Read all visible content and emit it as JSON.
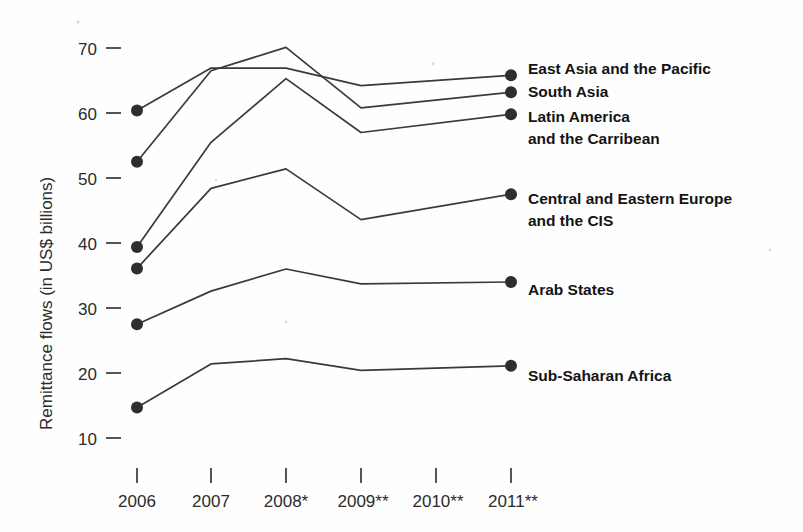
{
  "chart_data": {
    "type": "line",
    "title": "",
    "xlabel": "",
    "ylabel": "Remittance flows (in US$ billions)",
    "categories": [
      "2006",
      "2007",
      "2008*",
      "2009**",
      "2010**",
      "2011**"
    ],
    "x_tick_labels": [
      "2006",
      "2007",
      "2008*",
      "2009**",
      "2010**",
      "2011**"
    ],
    "y_tick_labels": [
      "70",
      "60",
      "50",
      "40",
      "30",
      "20",
      "10"
    ],
    "y_ticks": [
      70,
      60,
      50,
      40,
      30,
      20,
      10
    ],
    "ylim": [
      8,
      72
    ],
    "grid": false,
    "legend_position": "right-inline-labels",
    "marker_years": [
      "2006",
      "2011**"
    ],
    "footnote_markers": [
      "*",
      "**"
    ],
    "series": [
      {
        "name": "East Asia and the Pacific",
        "label": "East Asia and the Pacific",
        "values": [
          60.4,
          66.9,
          66.9,
          64.2,
          null,
          65.8
        ],
        "vertices": [
          {
            "x": "2006",
            "y": 60.4
          },
          {
            "x": "2007",
            "y": 66.9
          },
          {
            "x": "2008*",
            "y": 66.9
          },
          {
            "x": "2009**",
            "y": 64.2
          },
          {
            "x": "2011**",
            "y": 65.8
          }
        ]
      },
      {
        "name": "South Asia",
        "label": "South Asia",
        "values": [
          52.5,
          66.5,
          70.1,
          60.8,
          null,
          63.2
        ],
        "vertices": [
          {
            "x": "2006",
            "y": 52.5
          },
          {
            "x": "2007",
            "y": 66.5
          },
          {
            "x": "2008*",
            "y": 70.1
          },
          {
            "x": "2009**",
            "y": 60.8
          },
          {
            "x": "2011**",
            "y": 63.2
          }
        ]
      },
      {
        "name": "Latin America and the Carribean",
        "label_line1": "Latin America",
        "label_line2": "and the Carribean",
        "values": [
          39.4,
          55.5,
          65.3,
          57.0,
          null,
          59.8
        ],
        "vertices": [
          {
            "x": "2006",
            "y": 39.4
          },
          {
            "x": "2007",
            "y": 55.5
          },
          {
            "x": "2008*",
            "y": 65.3
          },
          {
            "x": "2009**",
            "y": 57.0
          },
          {
            "x": "2011**",
            "y": 59.8
          }
        ]
      },
      {
        "name": "Central and Eastern Europe and the CIS",
        "label_line1": "Central and Eastern Europe",
        "label_line2": "and the CIS",
        "values": [
          36.1,
          48.4,
          51.4,
          43.6,
          null,
          47.5
        ],
        "vertices": [
          {
            "x": "2006",
            "y": 36.1
          },
          {
            "x": "2007",
            "y": 48.4
          },
          {
            "x": "2008*",
            "y": 51.4
          },
          {
            "x": "2009**",
            "y": 43.6
          },
          {
            "x": "2011**",
            "y": 47.5
          }
        ]
      },
      {
        "name": "Arab States",
        "label": "Arab States",
        "values": [
          27.5,
          32.6,
          36.0,
          33.7,
          null,
          34.0
        ],
        "vertices": [
          {
            "x": "2006",
            "y": 27.5
          },
          {
            "x": "2007",
            "y": 32.6
          },
          {
            "x": "2008*",
            "y": 36.0
          },
          {
            "x": "2009**",
            "y": 33.7
          },
          {
            "x": "2011**",
            "y": 34.0
          }
        ]
      },
      {
        "name": "Sub-Saharan Africa",
        "label": "Sub-Saharan Africa",
        "values": [
          14.7,
          21.4,
          22.2,
          20.4,
          null,
          21.1
        ],
        "vertices": [
          {
            "x": "2006",
            "y": 14.7
          },
          {
            "x": "2007",
            "y": 21.4
          },
          {
            "x": "2008*",
            "y": 22.2
          },
          {
            "x": "2009**",
            "y": 20.4
          },
          {
            "x": "2011**",
            "y": 21.1
          }
        ]
      }
    ]
  },
  "axis": {
    "y_title": "Remittance flows (in US$ billions)"
  },
  "colors": {
    "line": "#3a3a3a",
    "marker": "#2e2e2e",
    "text": "#1a1a1a",
    "tick_text": "#2b2b2b",
    "background": "#fefefe"
  },
  "labels": {
    "east_asia": "East Asia and the Pacific",
    "south_asia": "South Asia",
    "latin_america_1": "Latin America",
    "latin_america_2": "and the Carribean",
    "cee_cis_1": "Central and Eastern Europe",
    "cee_cis_2": "and the CIS",
    "arab_states": "Arab States",
    "sub_saharan": "Sub-Saharan Africa"
  },
  "y_ticks": {
    "t70": "70",
    "t60": "60",
    "t50": "50",
    "t40": "40",
    "t30": "30",
    "t20": "20",
    "t10": "10"
  },
  "x_ticks": {
    "t2006": "2006",
    "t2007": "2007",
    "t2008": "2008*",
    "t2009": "2009**",
    "t2010": "2010**",
    "t2011": "2011**"
  }
}
